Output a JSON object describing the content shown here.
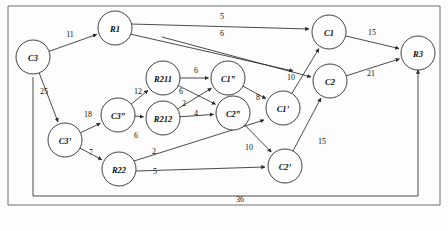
{
  "figure": {
    "title": "",
    "caption": "",
    "background_color": "#fdfdfd",
    "node_fill": "#ffffff",
    "stroke_color": "#2b2b2b",
    "frame_color": "#6f6f6f"
  },
  "chart_data": {
    "type": "diagram",
    "diagram_type": "directed-weighted-graph",
    "title": "",
    "xlabel": "",
    "ylabel": "",
    "grid": false,
    "legend": null,
    "nodes": [
      {
        "id": "C3",
        "label": "C3",
        "x": 33,
        "y": 57,
        "r": 17
      },
      {
        "id": "R1",
        "label": "R1",
        "x": 115,
        "y": 28,
        "r": 17
      },
      {
        "id": "C1",
        "label": "C1",
        "x": 329,
        "y": 32,
        "r": 17
      },
      {
        "id": "R3",
        "label": "R3",
        "x": 418,
        "y": 53,
        "r": 17
      },
      {
        "id": "C2",
        "label": "C2",
        "x": 330,
        "y": 81,
        "r": 17
      },
      {
        "id": "R211",
        "label": "R211",
        "x": 163,
        "y": 78,
        "r": 17
      },
      {
        "id": "C1dq",
        "label": "C1”",
        "x": 228,
        "y": 78,
        "r": 17
      },
      {
        "id": "C1q",
        "label": "C1’",
        "x": 283,
        "y": 108,
        "r": 17
      },
      {
        "id": "R212",
        "label": "R212",
        "x": 163,
        "y": 118,
        "r": 17
      },
      {
        "id": "C2dq",
        "label": "C2”",
        "x": 233,
        "y": 113,
        "r": 17
      },
      {
        "id": "C3dq",
        "label": "C3”",
        "x": 118,
        "y": 115,
        "r": 17
      },
      {
        "id": "C3q",
        "label": "C3’",
        "x": 65,
        "y": 140,
        "r": 17
      },
      {
        "id": "R22",
        "label": "R22",
        "x": 119,
        "y": 169,
        "r": 17
      },
      {
        "id": "C2q",
        "label": "C2’",
        "x": 285,
        "y": 166,
        "r": 17
      }
    ],
    "edges": [
      {
        "from": "C3",
        "to": "R1",
        "weight": "11",
        "lx": 70,
        "ly": 34
      },
      {
        "from": "R1",
        "to": "C1",
        "weight": "5",
        "lx": 222,
        "ly": 16
      },
      {
        "from": "R1",
        "to": "C2",
        "weight": "6",
        "lx": 222,
        "ly": 33
      },
      {
        "from": "R1",
        "to": "C2",
        "weight": "10",
        "lx": 291,
        "ly": 77
      },
      {
        "from": "C1",
        "to": "R3",
        "weight": "15",
        "lx": 372,
        "ly": 32
      },
      {
        "from": "C2",
        "to": "R3",
        "weight": "21",
        "lx": 371,
        "ly": 73
      },
      {
        "from": "C3",
        "to": "C3q",
        "weight": "25",
        "lx": 44,
        "ly": 91
      },
      {
        "from": "C3q",
        "to": "C3dq",
        "weight": "18",
        "lx": 88,
        "ly": 114
      },
      {
        "from": "C3dq",
        "to": "R211",
        "weight": "12",
        "lx": 138,
        "ly": 91
      },
      {
        "from": "C3dq",
        "to": "R212",
        "weight": "6",
        "lx": 136,
        "ly": 135
      },
      {
        "from": "R211",
        "to": "C1dq",
        "weight": "6",
        "lx": 196,
        "ly": 70
      },
      {
        "from": "R211",
        "to": "C2dq",
        "weight": "6",
        "lx": 181,
        "ly": 91
      },
      {
        "from": "R212",
        "to": "C1dq",
        "weight": "2",
        "lx": 184,
        "ly": 103
      },
      {
        "from": "R212",
        "to": "C2dq",
        "weight": "4",
        "lx": 196,
        "ly": 113
      },
      {
        "from": "C1dq",
        "to": "C1q",
        "weight": "8",
        "lx": 258,
        "ly": 97
      },
      {
        "from": "C1q",
        "to": "C1",
        "weight": "",
        "lx": 0,
        "ly": 0
      },
      {
        "from": "C2dq",
        "to": "C2q",
        "weight": "10",
        "lx": 249,
        "ly": 147
      },
      {
        "from": "C3q",
        "to": "R22",
        "weight": "7",
        "lx": 91,
        "ly": 152
      },
      {
        "from": "R22",
        "to": "C1q",
        "weight": "2",
        "lx": 154,
        "ly": 151
      },
      {
        "from": "R22",
        "to": "C2q",
        "weight": "5",
        "lx": 155,
        "ly": 171
      },
      {
        "from": "C2q",
        "to": "C2",
        "weight": "15",
        "lx": 322,
        "ly": 141
      },
      {
        "from": "R3",
        "to": "C3",
        "weight": "36",
        "lx": 240,
        "ly": 199
      }
    ],
    "weights_summary": [
      "11",
      "5",
      "6",
      "10",
      "15",
      "21",
      "25",
      "18",
      "12",
      "6",
      "6",
      "6",
      "2",
      "4",
      "8",
      "10",
      "7",
      "2",
      "5",
      "15",
      "36"
    ]
  }
}
